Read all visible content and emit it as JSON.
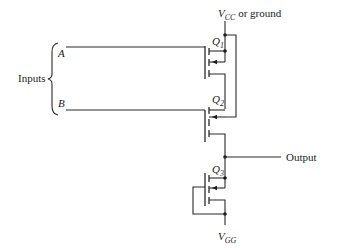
{
  "diagram": {
    "type": "MOSFET logic gate schematic",
    "labels": {
      "supply_main": "V",
      "supply_sub": "CC",
      "supply_suffix": " or ground",
      "inputs": "Inputs",
      "input_a": "A",
      "input_b": "B",
      "output": "Output",
      "ground_main": "V",
      "ground_sub": "GG"
    },
    "transistors": [
      {
        "id": "Q1",
        "main": "Q",
        "sub": "1",
        "gate_input": "A"
      },
      {
        "id": "Q2",
        "main": "Q",
        "sub": "2",
        "gate_input": "B"
      },
      {
        "id": "Q3",
        "main": "Q",
        "sub": "3",
        "gate_input": "self-biased load"
      }
    ],
    "colors": {
      "line": "#2a2a2a",
      "background": "#ffffff"
    }
  }
}
